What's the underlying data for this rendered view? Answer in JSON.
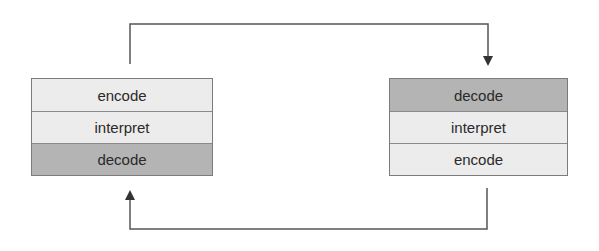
{
  "diagram": {
    "type": "protocol-stack-exchange",
    "colors": {
      "light_row": "#ececec",
      "dark_row": "#b4b4b4",
      "border": "#7b7b7b",
      "arrow": "#444444"
    },
    "left_stack": {
      "layers": [
        {
          "label": "encode",
          "shade": "light"
        },
        {
          "label": "interpret",
          "shade": "light"
        },
        {
          "label": "decode",
          "shade": "dark"
        }
      ]
    },
    "right_stack": {
      "layers": [
        {
          "label": "decode",
          "shade": "dark"
        },
        {
          "label": "interpret",
          "shade": "light"
        },
        {
          "label": "encode",
          "shade": "light"
        }
      ]
    },
    "arrows": [
      {
        "from": "left_stack.top",
        "to": "right_stack.top",
        "direction": "left-to-right over top"
      },
      {
        "from": "right_stack.bottom",
        "to": "left_stack.bottom",
        "direction": "right-to-left under bottom"
      }
    ]
  }
}
